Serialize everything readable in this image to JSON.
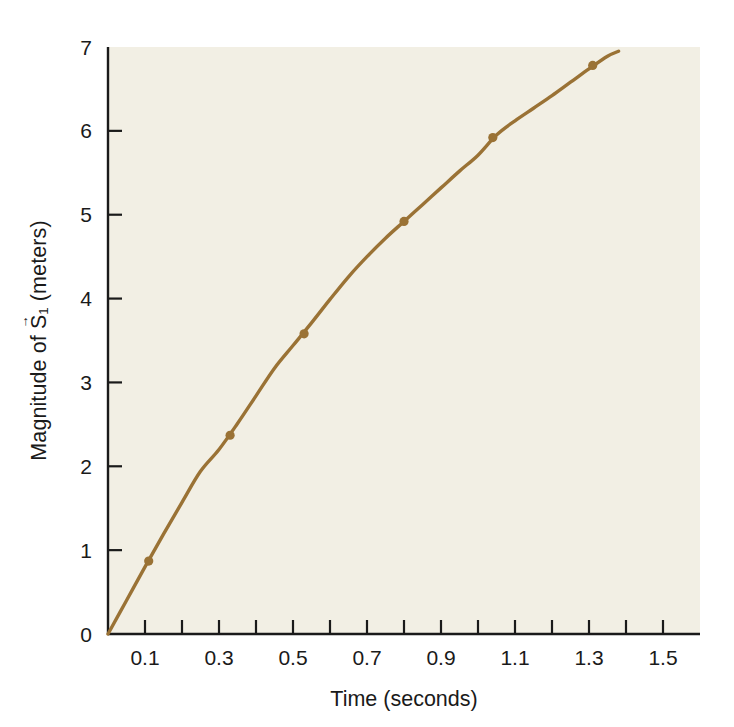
{
  "chart_data": {
    "type": "line",
    "title": "",
    "subtitle": "",
    "xlabel": "Time (seconds)",
    "ylabel_text": "Magnitude of S (meters)",
    "ylabel_parts": {
      "prefix": "Magnitude of ",
      "symbol": "S",
      "vector_arrow": "→",
      "subscript": "1",
      "suffix": " (meters)"
    },
    "xlim": [
      0.0,
      1.6
    ],
    "ylim": [
      0,
      7
    ],
    "grid": false,
    "legend": null,
    "x_tick_labels": [
      "0.1",
      "0.3",
      "0.5",
      "0.7",
      "0.9",
      "1.1",
      "1.3",
      "1.5"
    ],
    "x_tick_label_values": [
      0.1,
      0.3,
      0.5,
      0.7,
      0.9,
      1.1,
      1.3,
      1.5
    ],
    "x_minor_ticks": [
      0.0,
      0.1,
      0.2,
      0.3,
      0.4,
      0.5,
      0.6,
      0.7,
      0.8,
      0.9,
      1.0,
      1.1,
      1.2,
      1.3,
      1.4,
      1.5
    ],
    "y_tick_labels": [
      "0",
      "1",
      "2",
      "3",
      "4",
      "5",
      "6",
      "7"
    ],
    "y_tick_label_values": [
      0,
      1,
      2,
      3,
      4,
      5,
      6,
      7
    ],
    "series": [
      {
        "name": "Magnitude of S1",
        "color": "#9a7235",
        "marker": "circle",
        "marker_points": {
          "x": [
            0.11,
            0.33,
            0.53,
            0.8,
            1.04,
            1.31
          ],
          "y": [
            0.87,
            2.37,
            3.58,
            4.92,
            5.92,
            6.78
          ]
        },
        "curve": {
          "x": [
            0.0,
            0.05,
            0.1,
            0.15,
            0.2,
            0.25,
            0.3,
            0.35,
            0.4,
            0.45,
            0.5,
            0.55,
            0.6,
            0.65,
            0.7,
            0.75,
            0.8,
            0.85,
            0.9,
            0.95,
            1.0,
            1.05,
            1.1,
            1.15,
            1.2,
            1.25,
            1.3,
            1.35,
            1.38
          ],
          "y": [
            0.0,
            0.4,
            0.8,
            1.19,
            1.57,
            1.94,
            2.2,
            2.51,
            2.84,
            3.17,
            3.44,
            3.71,
            3.99,
            4.26,
            4.5,
            4.72,
            4.92,
            5.12,
            5.32,
            5.52,
            5.71,
            5.95,
            6.12,
            6.27,
            6.42,
            6.58,
            6.74,
            6.89,
            6.95
          ]
        }
      }
    ]
  },
  "colors": {
    "curve": "#9a7235",
    "marker": "#9a7235",
    "axis": "#1a1a1a",
    "plot_background": "#f2efe4",
    "page_background": "#ffffff",
    "text": "#1a1a1a"
  },
  "axis_geometry": {
    "plot_left_px": 108,
    "plot_right_px": 700,
    "plot_top_px": 47,
    "plot_bottom_px": 634
  }
}
